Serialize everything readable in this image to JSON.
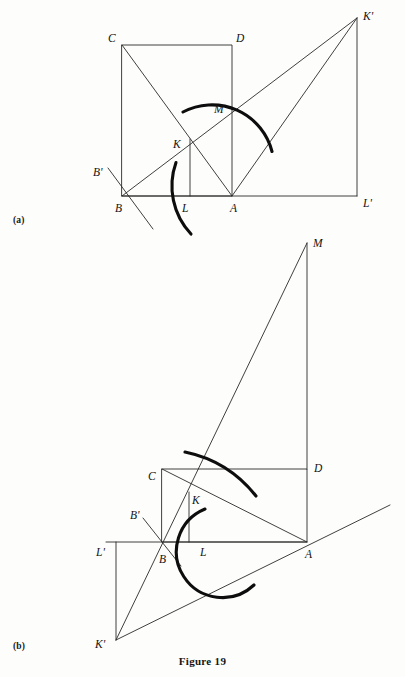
{
  "figure": {
    "caption": "Figure 19",
    "panel_a_tag": "(a)",
    "panel_b_tag": "(b)"
  },
  "panel_a": {
    "tag": "(a)",
    "labels": {
      "C": "C",
      "D": "D",
      "B": "B",
      "A": "A",
      "K": "K",
      "L": "L",
      "M": "M",
      "Bprime": "B'",
      "Kprime": "K'",
      "Lprime": "L'"
    },
    "points": {
      "C": [
        122,
        45
      ],
      "D": [
        232,
        45
      ],
      "B": [
        122,
        196
      ],
      "A": [
        232,
        196
      ],
      "K": [
        190,
        143
      ],
      "L": [
        190,
        196
      ],
      "M": [
        218,
        117
      ],
      "Kprime": [
        357,
        18
      ],
      "Lprime": [
        357,
        196
      ],
      "Bprime_start": [
        108,
        170
      ],
      "Bprime_end": [
        152,
        228
      ]
    },
    "arcs": [
      {
        "name": "arc-through-K",
        "center": "A",
        "radius": 62
      },
      {
        "name": "arc-through-L",
        "center": "B",
        "radius": 70
      }
    ]
  },
  "panel_b": {
    "tag": "(b)",
    "labels": {
      "C": "C",
      "D": "D",
      "B": "B",
      "A": "A",
      "K": "K",
      "L": "L",
      "M": "M",
      "Bprime": "B'",
      "Kprime": "K'",
      "Lprime": "L'"
    },
    "points": {
      "C": [
        162,
        469
      ],
      "D": [
        307,
        469
      ],
      "B": [
        162,
        542
      ],
      "A": [
        307,
        542
      ],
      "K": [
        189,
        497
      ],
      "L": [
        200,
        553
      ],
      "M": [
        307,
        243
      ],
      "Kprime": [
        116,
        640
      ],
      "Lprime": [
        116,
        542
      ],
      "Bprime_start": [
        142,
        520
      ],
      "Bprime_end": [
        180,
        565
      ]
    },
    "arcs": [
      {
        "name": "arc-through-K",
        "center": "A",
        "radius": 122
      },
      {
        "name": "arc-through-L",
        "center": "B",
        "radius": 46
      }
    ]
  }
}
